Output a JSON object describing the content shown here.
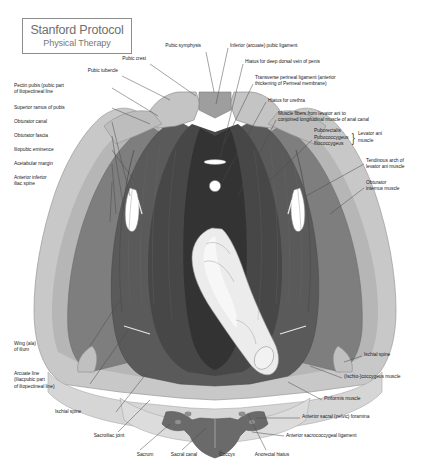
{
  "title_card": {
    "line1": "Stanford Protocol",
    "line2": "Physical Therapy",
    "border_color": "#8d8d8d"
  },
  "figure": {
    "name": "pelvic-floor-anatomy-diagram",
    "view": "superior view of female/male pelvic floor musculature",
    "palette": {
      "background": "#ffffff",
      "bone_light": "#c8c8c8",
      "bone_mid": "#b0b0b0",
      "muscle_mid": "#5a5a5a",
      "muscle_dark": "#3f3f3f",
      "muscle_darkest": "#2e2e2e",
      "sacrum_band": "#d6d6d6",
      "coccyx": "#6a6a6a",
      "bone_cream": "#ececec",
      "outline": "#6b6b6b",
      "hiatus_white": "#ffffff"
    }
  },
  "labels_left": [
    {
      "text": "Pectin pubis (pubic part\nof iliopectineal line",
      "x": 14,
      "y": 83,
      "w": 94
    },
    {
      "text": "Superior ramus of pubis",
      "x": 14,
      "y": 105,
      "w": 94
    },
    {
      "text": "Obturator canal",
      "x": 14,
      "y": 119,
      "w": 94
    },
    {
      "text": "Obturator fascia",
      "x": 14,
      "y": 133,
      "w": 94
    },
    {
      "text": "Iliopubic eminence",
      "x": 14,
      "y": 147,
      "w": 94
    },
    {
      "text": "Acetabular margin",
      "x": 14,
      "y": 161,
      "w": 94
    },
    {
      "text": "Anterior inferior\niliac spine",
      "x": 14,
      "y": 175,
      "w": 94
    },
    {
      "text": "Wing (ala)\nof ilium",
      "x": 14,
      "y": 341,
      "w": 72
    },
    {
      "text": "Arcuate line\n(iliacpubic part\nof iliopectineal line)",
      "x": 14,
      "y": 371,
      "w": 72
    },
    {
      "text": "Ischial spine",
      "x": 55,
      "y": 409,
      "w": 58
    }
  ],
  "labels_top": [
    {
      "text": "Pubic tubercle",
      "x": 58,
      "y": 68,
      "w": 60,
      "align": "right"
    },
    {
      "text": "Pubic crest",
      "x": 88,
      "y": 56,
      "w": 58,
      "align": "right"
    },
    {
      "text": "Pubic symphysis",
      "x": 139,
      "y": 43,
      "w": 62,
      "align": "right"
    }
  ],
  "labels_right": [
    {
      "text": "Inferior (arcuate) pubic ligament",
      "x": 230,
      "y": 43,
      "w": 130
    },
    {
      "text": "Hiatus for deep dorsal vein of penis",
      "x": 245,
      "y": 59,
      "w": 140
    },
    {
      "text": "Transverse perineal ligament (anterior\nthickening of Perineal membrane)",
      "x": 255,
      "y": 75,
      "w": 150
    },
    {
      "text": "Hiatus for urethra",
      "x": 268,
      "y": 98,
      "w": 130
    },
    {
      "text": "Muscle fibers from levator ani to\nconjoined longitudinal muscle of anal canal",
      "x": 278,
      "y": 111,
      "w": 150
    },
    {
      "text": "Tendinous arch of\nlevator ani muscle",
      "x": 366,
      "y": 158,
      "w": 64
    },
    {
      "text": "Obturator\ninternus muscle",
      "x": 366,
      "y": 180,
      "w": 64
    }
  ],
  "bracket_group": {
    "items": [
      "Puborectalis",
      "Pubococcygeus",
      "Iliococcygeus"
    ],
    "bracket_glyph": "}",
    "group_label": "Levator ani\nmuscle",
    "x": 314,
    "y": 128
  },
  "labels_bottom_right": [
    {
      "text": "Ischial spine",
      "x": 364,
      "y": 352,
      "w": 62
    },
    {
      "text": "(Ischio-)coccygeus muscle",
      "x": 344,
      "y": 374,
      "w": 84
    },
    {
      "text": "Piriformis muscle",
      "x": 324,
      "y": 396,
      "w": 84
    },
    {
      "text": "Anterior sacral (pelvic) foramina",
      "x": 302,
      "y": 414,
      "w": 126
    },
    {
      "text": "Anterior sacrococcygeal ligament",
      "x": 286,
      "y": 433,
      "w": 142
    }
  ],
  "labels_bottom": [
    {
      "text": "Sacroiliac joint",
      "x": 81,
      "y": 433,
      "w": 56
    },
    {
      "text": "Sacrum",
      "x": 124,
      "y": 452,
      "w": 42
    },
    {
      "text": "Sacral canal",
      "x": 161,
      "y": 452,
      "w": 46
    },
    {
      "text": "Coccyx",
      "x": 208,
      "y": 452,
      "w": 38
    },
    {
      "text": "Anorectal hiatus",
      "x": 243,
      "y": 452,
      "w": 58
    }
  ]
}
